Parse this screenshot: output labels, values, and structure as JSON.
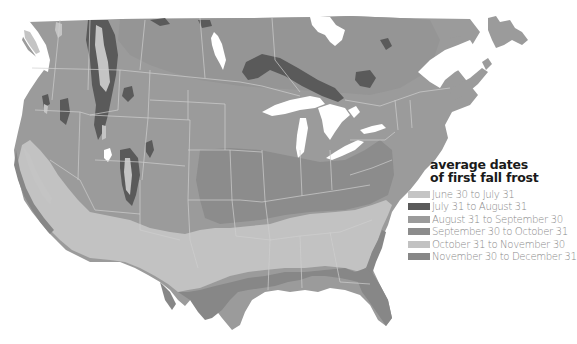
{
  "map": {
    "subject": "First fall frost dates, United States and southern Canada",
    "colors": {
      "background": "#ffffff",
      "water": "#ffffff",
      "border": "#c9c9c9",
      "june_july": "#c4c4c4",
      "july_august": "#5a5a5a",
      "august_september": "#9a9a9a",
      "september_october": "#8a8a8a",
      "october_november": "#c0c0c0",
      "november_december": "#858585"
    }
  },
  "legend": {
    "title_line1": "average dates",
    "title_line2": "of first fall frost",
    "items": [
      {
        "label": "June 30 to July 31",
        "color": "#c4c4c4"
      },
      {
        "label": "July 31 to August 31",
        "color": "#5a5a5a"
      },
      {
        "label": "August 31 to September 30",
        "color": "#9b9b9b"
      },
      {
        "label": "September 30 to October 31",
        "color": "#8c8c8c"
      },
      {
        "label": "October 31 to November 30",
        "color": "#c2c2c2"
      },
      {
        "label": "November 30 to December 31",
        "color": "#878787"
      }
    ]
  }
}
